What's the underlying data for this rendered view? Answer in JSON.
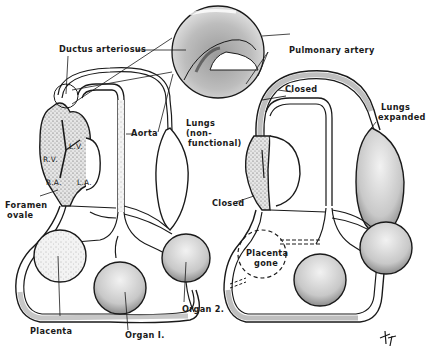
{
  "diagram": {
    "type": "anatomical-illustration",
    "ink_color": "#1a1a1a",
    "stipple_color": "#8a8a8a",
    "background": "#ffffff"
  },
  "left_panel": {
    "heart_chambers": {
      "rv": "R.V.",
      "lv": "L.V.",
      "ra": "R.A.",
      "la": "L.A."
    },
    "labels": {
      "ductus_arteriosus": "Ductus arteriosus",
      "aorta": "Aorta",
      "lungs_line1": "Lungs",
      "lungs_line2": "(non-",
      "lungs_line3": "functional)",
      "foramen_line1": "Foramen",
      "foramen_line2": "ovale",
      "placenta": "Placenta",
      "organ1": "Organ I.",
      "organ2": "Organ 2."
    }
  },
  "right_panel": {
    "labels": {
      "pulmonary_artery": "Pulmonary artery",
      "closed_top": "Closed",
      "lungs_line1": "Lungs",
      "lungs_line2": "expanded",
      "closed_side": "Closed",
      "placenta_gone_line1": "Placenta",
      "placenta_gone_line2": "gone"
    }
  },
  "signature": "ℸ⁊"
}
